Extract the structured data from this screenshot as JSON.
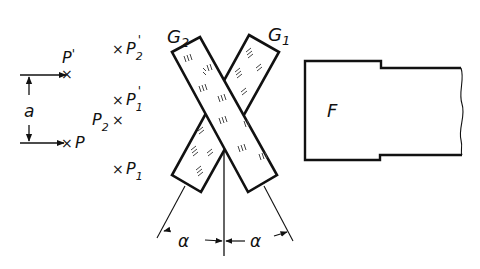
{
  "diagram": {
    "points": {
      "p_prime": "P'",
      "p": "P",
      "p2_prime": "P2'",
      "p1_prime": "P1'",
      "p2": "P2",
      "p1": "P1"
    },
    "point_labels": {
      "p_prime": {
        "main": "P",
        "sub": "",
        "sup": "'"
      },
      "p": {
        "main": "P",
        "sub": "",
        "sup": ""
      },
      "p2_prime": {
        "main": "P",
        "sub": "2",
        "sup": "'"
      },
      "p1_prime": {
        "main": "P",
        "sub": "1",
        "sup": "'"
      },
      "p2": {
        "main": "P",
        "sub": "2",
        "sup": ""
      },
      "p1": {
        "main": "P",
        "sub": "1",
        "sup": ""
      }
    },
    "marker": "×",
    "dimension_label": "a",
    "plates": [
      {
        "id": "G1",
        "main": "G",
        "sub": "1"
      },
      {
        "id": "G2",
        "main": "G",
        "sub": "2"
      }
    ],
    "angle_label": "α",
    "object_label": "F",
    "colors": {
      "line": "#111111",
      "background": "#ffffff",
      "hatch": "#444444"
    }
  }
}
